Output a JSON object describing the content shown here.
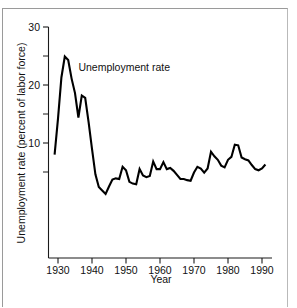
{
  "figure": {
    "background_color": "#ffffff",
    "line_color": "#000000",
    "axis_color": "#1a1a1a",
    "frame_color": "#9a9a9a"
  },
  "annotation_label": "Unemployment rate",
  "axis": {
    "y_title": "Unemployment rate (percent of labor force)",
    "x_title": "Year",
    "y_ticks_major": [
      "10",
      "20",
      "30"
    ],
    "x_ticks": [
      "1930",
      "1940",
      "1950",
      "1960",
      "1970",
      "1980",
      "1990"
    ]
  },
  "chart_data": {
    "type": "line",
    "title": "",
    "subtitle": "",
    "xlabel": "Year",
    "ylabel": "Unemployment rate (percent of labor force)",
    "xlim": [
      1929,
      1991
    ],
    "ylim": [
      0,
      30
    ],
    "xticks": [
      1930,
      1940,
      1950,
      1960,
      1970,
      1980,
      1990
    ],
    "yticks_major": [
      10,
      20,
      30
    ],
    "yticks_minor": [
      5,
      15,
      25
    ],
    "grid": false,
    "legend": false,
    "annotations": [
      {
        "text": "Unemployment rate",
        "x": 1936,
        "y": 22.5
      }
    ],
    "series": [
      {
        "name": "Unemployment rate",
        "color": "#000000",
        "x": [
          1929,
          1930,
          1931,
          1932,
          1933,
          1934,
          1935,
          1936,
          1937,
          1938,
          1939,
          1940,
          1941,
          1942,
          1943,
          1944,
          1945,
          1946,
          1947,
          1948,
          1949,
          1950,
          1951,
          1952,
          1953,
          1954,
          1955,
          1956,
          1957,
          1958,
          1959,
          1960,
          1961,
          1962,
          1963,
          1964,
          1965,
          1966,
          1967,
          1968,
          1969,
          1970,
          1971,
          1972,
          1973,
          1974,
          1975,
          1976,
          1977,
          1978,
          1979,
          1980,
          1981,
          1982,
          1983,
          1984,
          1985,
          1986,
          1987,
          1988,
          1989,
          1990,
          1991
        ],
        "y": [
          8.0,
          14.2,
          21.3,
          24.9,
          24.3,
          21.1,
          18.6,
          14.4,
          18.2,
          17.8,
          13.6,
          9.0,
          4.6,
          2.4,
          1.8,
          1.2,
          2.5,
          3.7,
          3.9,
          3.8,
          5.9,
          5.3,
          3.3,
          3.0,
          2.9,
          5.5,
          4.4,
          4.1,
          4.3,
          6.8,
          5.5,
          5.5,
          6.7,
          5.5,
          5.7,
          5.2,
          4.5,
          3.8,
          3.8,
          3.6,
          3.5,
          4.9,
          5.9,
          5.6,
          4.9,
          5.6,
          8.5,
          7.7,
          7.1,
          6.1,
          5.8,
          7.1,
          7.6,
          9.7,
          9.6,
          7.5,
          7.2,
          7.0,
          6.2,
          5.5,
          5.3,
          5.6,
          6.3
        ]
      }
    ]
  }
}
